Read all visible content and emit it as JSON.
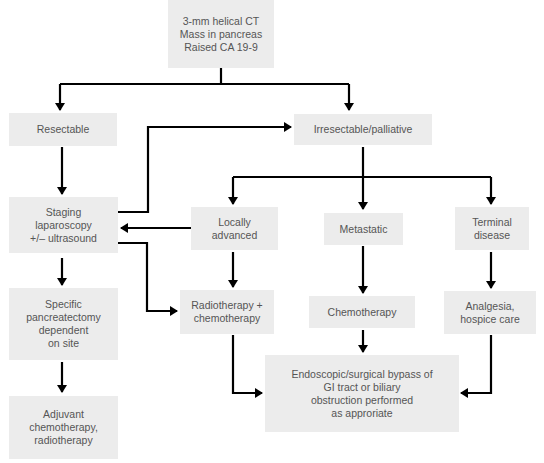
{
  "diagram": {
    "type": "flowchart",
    "colors": {
      "box_fill": "#ececec",
      "text": "#555555",
      "arrow": "#000000",
      "background": "#ffffff"
    },
    "nodes": {
      "start": {
        "label": "3-mm helical CT\nMass in pancreas\nRaised CA 19-9"
      },
      "resectable": {
        "label": "Resectable"
      },
      "irresectable": {
        "label": "Irresectable/palliative"
      },
      "staging": {
        "label": "Staging\nlaparoscopy\n+/– ultrasound"
      },
      "locally_advanced": {
        "label": "Locally\nadvanced"
      },
      "metastatic": {
        "label": "Metastatic"
      },
      "terminal": {
        "label": "Terminal\ndisease"
      },
      "pancreatectomy": {
        "label": "Specific\npancreatectomy\ndependent\non site"
      },
      "radio_chemo": {
        "label": "Radiotherapy +\nchemotherapy"
      },
      "chemotherapy": {
        "label": "Chemotherapy"
      },
      "analgesia": {
        "label": "Analgesia,\nhospice care"
      },
      "adjuvant": {
        "label": "Adjuvant\nchemotherapy,\nradiotherapy"
      },
      "bypass": {
        "label": "Endoscopic/surgical  bypass of\nGI tract or biliary\nobstruction performed\nas approriate"
      }
    },
    "edges": [
      {
        "from": "start",
        "to": "resectable"
      },
      {
        "from": "start",
        "to": "irresectable"
      },
      {
        "from": "resectable",
        "to": "staging"
      },
      {
        "from": "staging",
        "to": "irresectable"
      },
      {
        "from": "irresectable",
        "to": "locally_advanced"
      },
      {
        "from": "irresectable",
        "to": "metastatic"
      },
      {
        "from": "irresectable",
        "to": "terminal"
      },
      {
        "from": "locally_advanced",
        "to": "staging"
      },
      {
        "from": "staging",
        "to": "pancreatectomy"
      },
      {
        "from": "staging",
        "to": "radio_chemo"
      },
      {
        "from": "locally_advanced",
        "to": "radio_chemo"
      },
      {
        "from": "metastatic",
        "to": "chemotherapy"
      },
      {
        "from": "terminal",
        "to": "analgesia"
      },
      {
        "from": "pancreatectomy",
        "to": "adjuvant"
      },
      {
        "from": "radio_chemo",
        "to": "bypass"
      },
      {
        "from": "chemotherapy",
        "to": "bypass"
      },
      {
        "from": "analgesia",
        "to": "bypass"
      }
    ]
  }
}
